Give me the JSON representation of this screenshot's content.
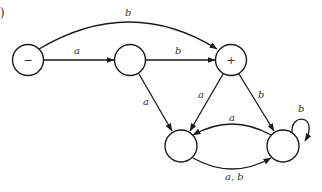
{
  "figure": {
    "corner_mark": ")",
    "type": "finite automaton state diagram"
  },
  "nodes": [
    {
      "id": "n1",
      "label": "−",
      "role": "start"
    },
    {
      "id": "n2",
      "label": ""
    },
    {
      "id": "n3",
      "label": "+",
      "role": "final"
    },
    {
      "id": "n4",
      "label": ""
    },
    {
      "id": "n5",
      "label": ""
    }
  ],
  "edges": [
    {
      "from": "n1",
      "to": "n2",
      "label": "a"
    },
    {
      "from": "n1",
      "to": "n3",
      "label": "b"
    },
    {
      "from": "n2",
      "to": "n3",
      "label": "b"
    },
    {
      "from": "n2",
      "to": "n4",
      "label": "a"
    },
    {
      "from": "n3",
      "to": "n4",
      "label": "a"
    },
    {
      "from": "n3",
      "to": "n5",
      "label": "b"
    },
    {
      "from": "n5",
      "to": "n4",
      "label": "a"
    },
    {
      "from": "n4",
      "to": "n5",
      "label": "a, b"
    },
    {
      "from": "n5",
      "to": "n5",
      "label": "b"
    }
  ]
}
